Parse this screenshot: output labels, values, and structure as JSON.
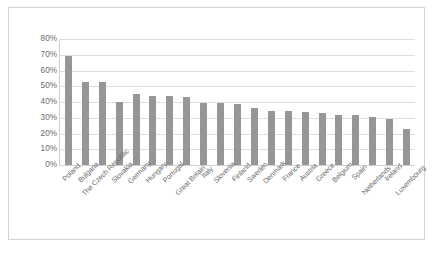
{
  "chart_data": {
    "type": "bar",
    "title": "",
    "subtitle": "",
    "xlabel": "",
    "ylabel": "",
    "ylim": [
      0,
      80
    ],
    "grid": true,
    "legend": "none",
    "y_ticks": [
      "0%",
      "10%",
      "20%",
      "30%",
      "40%",
      "50%",
      "60%",
      "70%",
      "80%"
    ],
    "y_tick_values": [
      0,
      10,
      20,
      30,
      40,
      50,
      60,
      70,
      80
    ],
    "bar_color": "#969696",
    "gridline_color": "#dedede",
    "axis_text_color": "#6b6b6b",
    "frame_color": "#d4d4d4",
    "background": "#ffffff",
    "categories": [
      "Poland",
      "Bulgaria",
      "The Czech Republic",
      "Slovakia",
      "Germany",
      "Hungary",
      "Portugal",
      "Great Britain",
      "Italy",
      "Slovenia",
      "Finland",
      "Sweden",
      "Denmark",
      "France",
      "Austria",
      "Greece",
      "Belgium",
      "Spain",
      "Netherlands",
      "Ireland",
      "Luxembourg"
    ],
    "values": [
      69,
      52.5,
      52.5,
      40,
      45,
      44,
      44,
      43.5,
      39.5,
      39.5,
      38.5,
      36.5,
      34.5,
      34.5,
      33.5,
      33,
      31.5,
      31.5,
      30.5,
      29.5,
      23
    ]
  }
}
